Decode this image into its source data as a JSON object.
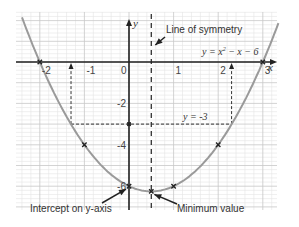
{
  "chart_data": {
    "type": "line",
    "title": "",
    "xlabel": "x",
    "ylabel": "y",
    "xlim": [
      -2.5,
      3.3
    ],
    "ylim": [
      -7,
      2.4
    ],
    "grid": true,
    "x_ticks": [
      -2,
      -1,
      0,
      1,
      2,
      3
    ],
    "x_tick_labels": [
      "-2",
      "-1",
      "0",
      "1",
      "2",
      "3"
    ],
    "y_ticks": [
      -2,
      -4,
      -6
    ],
    "y_tick_labels": [
      "-2",
      "-4",
      "-6"
    ],
    "series": [
      {
        "name": "y = x² − x − 6",
        "equation": "y = x^2 - x - 6",
        "coefficients": {
          "a": 1,
          "b": -1,
          "c": -6
        },
        "x_range": [
          -2.4,
          3.35
        ]
      }
    ],
    "marked_points": [
      {
        "x": -2,
        "y": 0
      },
      {
        "x": 3,
        "y": 0
      },
      {
        "x": -1,
        "y": -4
      },
      {
        "x": 2,
        "y": -4
      },
      {
        "x": 0,
        "y": -6
      },
      {
        "x": 0.5,
        "y": -6.25
      },
      {
        "x": 1,
        "y": -6
      }
    ],
    "symmetry_line": {
      "x": 0.5,
      "label": "Line of symmetry"
    },
    "horizontal_line": {
      "y": -3,
      "label": "y = -3",
      "x_intersections": [
        -1.3,
        2.3
      ]
    },
    "equation_label": {
      "prefix": "y = x",
      "sup": "2",
      "suffix": " − x − 6"
    },
    "annotations": [
      {
        "text": "Line of symmetry",
        "points_to": "symmetry-line"
      },
      {
        "text": "Intercept on y-axis",
        "points_to": [
          0,
          -6
        ]
      },
      {
        "text": "Minimum value",
        "points_to": [
          0.5,
          -6.25
        ]
      }
    ]
  }
}
